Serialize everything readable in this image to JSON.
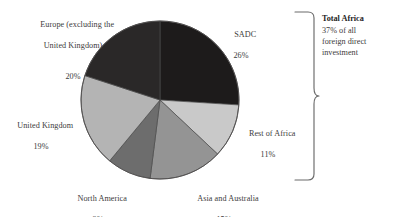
{
  "chart_data": {
    "type": "pie",
    "title": "",
    "categories": [
      "SADC",
      "Rest of Africa",
      "Asia and Australia",
      "North America",
      "United Kingdom",
      "Europe (excluding the United Kingdom)"
    ],
    "values": [
      26,
      11,
      15,
      9,
      19,
      20
    ],
    "value_suffix": "%",
    "start_angle_deg": 0,
    "direction": "clockwise",
    "legend": "none",
    "grid": false,
    "slice_colors": [
      "#1d1b1b",
      "#c9c9c9",
      "#949494",
      "#6d6d6d",
      "#b4b4b4",
      "#2a2828"
    ],
    "annotations": [
      {
        "name": "total-africa",
        "title": "Total Africa",
        "body": "37% of all foreign direct investment",
        "covers": [
          "SADC",
          "Rest of Africa"
        ]
      }
    ]
  },
  "labels": {
    "sadc": {
      "name": "SADC",
      "pct": "26%"
    },
    "rest_of_africa": {
      "name": "Rest of Africa",
      "pct": "11%"
    },
    "asia_australia": {
      "name": "Asia and Australia",
      "pct": "15%"
    },
    "north_america": {
      "name": "North America",
      "pct": "9%"
    },
    "united_kingdom": {
      "name": "United Kingdom",
      "pct": "19%"
    },
    "europe": {
      "line1": "Europe (excluding the",
      "line2": "United Kingdom)",
      "pct": "20%"
    }
  },
  "annotation": {
    "title": "Total Africa",
    "line1": "37% of all",
    "line2": "foreign direct",
    "line3": "investment"
  },
  "colors": {
    "background": "#ffffff",
    "text": "#3d3b3b",
    "outline": "#4a4a4a",
    "brace": "#6a6a6a",
    "sadc": "#1d1b1b",
    "rest_of_africa": "#c9c9c9",
    "asia_australia": "#949494",
    "north_america": "#6d6d6d",
    "united_kingdom": "#b4b4b4",
    "europe": "#2a2828"
  }
}
